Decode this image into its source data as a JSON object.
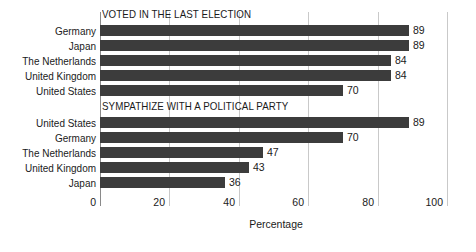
{
  "chart_data": {
    "type": "bar",
    "orientation": "horizontal",
    "title": "",
    "xlabel": "Percentage",
    "ylabel": "",
    "xlim": [
      0,
      100
    ],
    "xticks": [
      0,
      20,
      40,
      60,
      80,
      100
    ],
    "xtick_labels": [
      "0",
      "20",
      "40",
      "60",
      "80",
      "100"
    ],
    "grid": true,
    "legend": null,
    "bar_color": "#3c3c3c",
    "gridline_color": "#c9c9c9",
    "panels": [
      {
        "title": "VOTED IN THE LAST ELECTION",
        "categories": [
          "Germany",
          "Japan",
          "The Netherlands",
          "United Kingdom",
          "United States"
        ],
        "values": [
          89,
          89,
          84,
          84,
          70
        ],
        "value_labels": [
          "89",
          "89",
          "84",
          "84",
          "70"
        ]
      },
      {
        "title": "SYMPATHIZE WITH A POLITICAL PARTY",
        "categories": [
          "United States",
          "Germany",
          "The Netherlands",
          "United Kingdom",
          "Japan"
        ],
        "values": [
          89,
          70,
          47,
          43,
          36
        ],
        "value_labels": [
          "89",
          "70",
          "47",
          "43",
          "36"
        ]
      }
    ]
  }
}
